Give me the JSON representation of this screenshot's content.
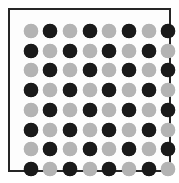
{
  "image": {
    "title": "Checkerboard dot matrix",
    "width": 179,
    "height": 183,
    "background_color": "#ffffff"
  },
  "frame": {
    "name": "outer-border",
    "border_color": "#262626",
    "border_width_px": 2,
    "fill_color": "#fdfdfd"
  },
  "chart_data": {
    "type": "heatmap",
    "subtitle": "",
    "xlabel": "",
    "ylabel": "",
    "rows": 8,
    "cols": 8,
    "total_markers": 64,
    "marker_shape": "circle",
    "marker_diameter_px": 14,
    "marker_pitch_px": 20,
    "grid": false,
    "legend_position": "none",
    "categories": [
      "C1",
      "C2",
      "C3",
      "C4",
      "C5",
      "C6",
      "C7",
      "C8"
    ],
    "row_labels": [
      "R1",
      "R2",
      "R3",
      "R4",
      "R5",
      "R6",
      "R7",
      "R8"
    ],
    "tick_labels_x": [],
    "tick_labels_y": [],
    "annotations": [],
    "value_map": {
      "0": "light",
      "1": "dark"
    },
    "colors": {
      "light": "#b3b3b3",
      "dark": "#1a1a1a"
    },
    "legend": [
      {
        "label": "light",
        "color": "#b3b3b3"
      },
      {
        "label": "dark",
        "color": "#1a1a1a"
      }
    ],
    "values": [
      [
        0,
        1,
        0,
        1,
        0,
        1,
        0,
        1
      ],
      [
        1,
        0,
        1,
        0,
        1,
        0,
        1,
        0
      ],
      [
        0,
        1,
        0,
        1,
        0,
        1,
        0,
        1
      ],
      [
        1,
        0,
        1,
        0,
        1,
        0,
        1,
        0
      ],
      [
        0,
        1,
        0,
        1,
        0,
        1,
        0,
        1
      ],
      [
        1,
        0,
        1,
        0,
        1,
        0,
        1,
        0
      ],
      [
        0,
        1,
        0,
        1,
        0,
        1,
        0,
        1
      ],
      [
        1,
        0,
        1,
        0,
        1,
        0,
        1,
        0
      ]
    ]
  }
}
